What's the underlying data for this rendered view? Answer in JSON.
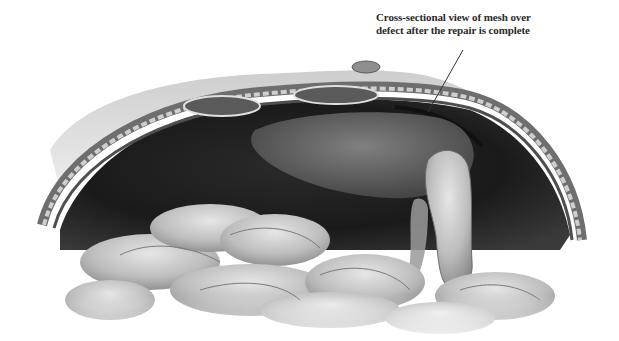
{
  "figure": {
    "caption_line_1": "Cross-sectional view of mesh over",
    "caption_line_2": "defect after the repair is complete",
    "colors": {
      "background": "#ffffff",
      "cavity": "#1c1c1c",
      "wall_outer": "#9a9a9a",
      "tissue_light": "#d4d4d4",
      "caption_text": "#2a2a2a"
    }
  }
}
